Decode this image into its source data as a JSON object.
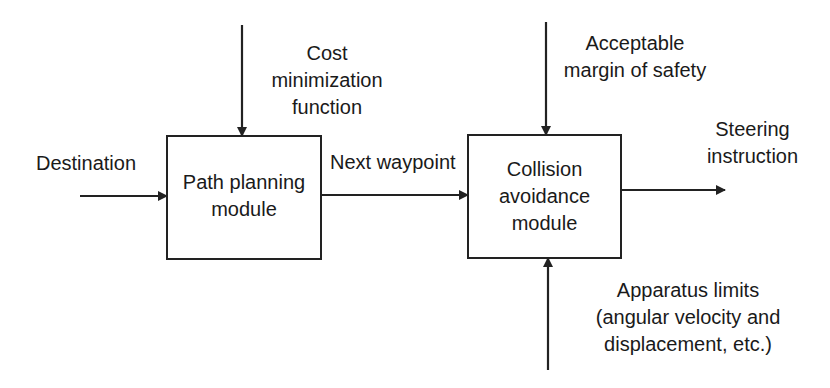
{
  "diagram": {
    "blocks": [
      {
        "id": "path-planning",
        "lines": [
          "Path planning",
          "module"
        ]
      },
      {
        "id": "collision-avoidance",
        "lines": [
          "Collision",
          "avoidance",
          "module"
        ]
      }
    ],
    "labels": {
      "destination": "Destination",
      "cost": [
        "Cost",
        "minimization",
        "function"
      ],
      "next_waypoint": "Next waypoint",
      "margin": [
        "Acceptable",
        "margin of safety"
      ],
      "steering": [
        "Steering",
        "instruction"
      ],
      "apparatus": [
        "Apparatus limits",
        "(angular velocity and",
        "displacement, etc.)"
      ]
    },
    "edges": [
      {
        "from": "Destination",
        "to": "path-planning"
      },
      {
        "from": "Cost minimization function",
        "to": "path-planning"
      },
      {
        "from": "path-planning",
        "to": "collision-avoidance",
        "label": "Next waypoint"
      },
      {
        "from": "Acceptable margin of safety",
        "to": "collision-avoidance"
      },
      {
        "from": "Apparatus limits",
        "to": "collision-avoidance"
      },
      {
        "from": "collision-avoidance",
        "to": "Steering instruction"
      }
    ]
  }
}
